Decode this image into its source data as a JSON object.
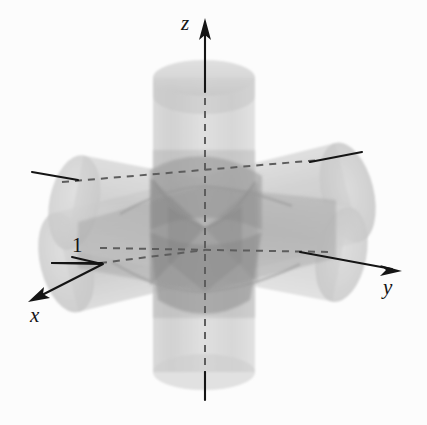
{
  "figure": {
    "background_color": "#fcfcfc",
    "axes": [
      {
        "id": "x",
        "label": "x",
        "label_x": 30,
        "label_y": 322,
        "italic": true,
        "direction": "lower-left",
        "has_arrow": true
      },
      {
        "id": "y",
        "label": "y",
        "label_x": 383,
        "label_y": 294,
        "italic": true,
        "direction": "lower-right",
        "has_arrow": true
      },
      {
        "id": "z",
        "label": "z",
        "label_x": 181,
        "label_y": 30,
        "italic": true,
        "direction": "up",
        "has_arrow": true
      }
    ],
    "annotations": [
      {
        "id": "radius",
        "label": "1",
        "label_x": 72,
        "label_y": 252,
        "description": "cylinder radius measurement with leader line"
      }
    ],
    "colors": {
      "ink": "#151515",
      "dashed_axis": "#5d5d5d",
      "cylinder_light": "#d2d2d2",
      "cylinder_mid": "#bdbdbd",
      "cylinder_dark": "#a2a2a2",
      "intersection_dark": "#8c8c8c",
      "intersection_darkest": "#7a7a7a",
      "background": "#fcfcfc"
    },
    "geometry": {
      "origin": {
        "x": 205,
        "y": 228
      },
      "vertical_cylinder": {
        "axis": "z",
        "top_y": 62,
        "bottom_y": 372,
        "left_x": 153,
        "right_x": 255,
        "radius_px": 51
      },
      "horizontal_cylinder_y": {
        "axis": "y",
        "left_end": {
          "x": 60,
          "y": 280
        },
        "right_end": {
          "x": 355,
          "y": 205
        }
      },
      "horizontal_cylinder_x": {
        "axis": "x",
        "near_end": {
          "x": 95,
          "y": 215
        },
        "far_end": {
          "x": 345,
          "y": 255
        }
      }
    }
  }
}
